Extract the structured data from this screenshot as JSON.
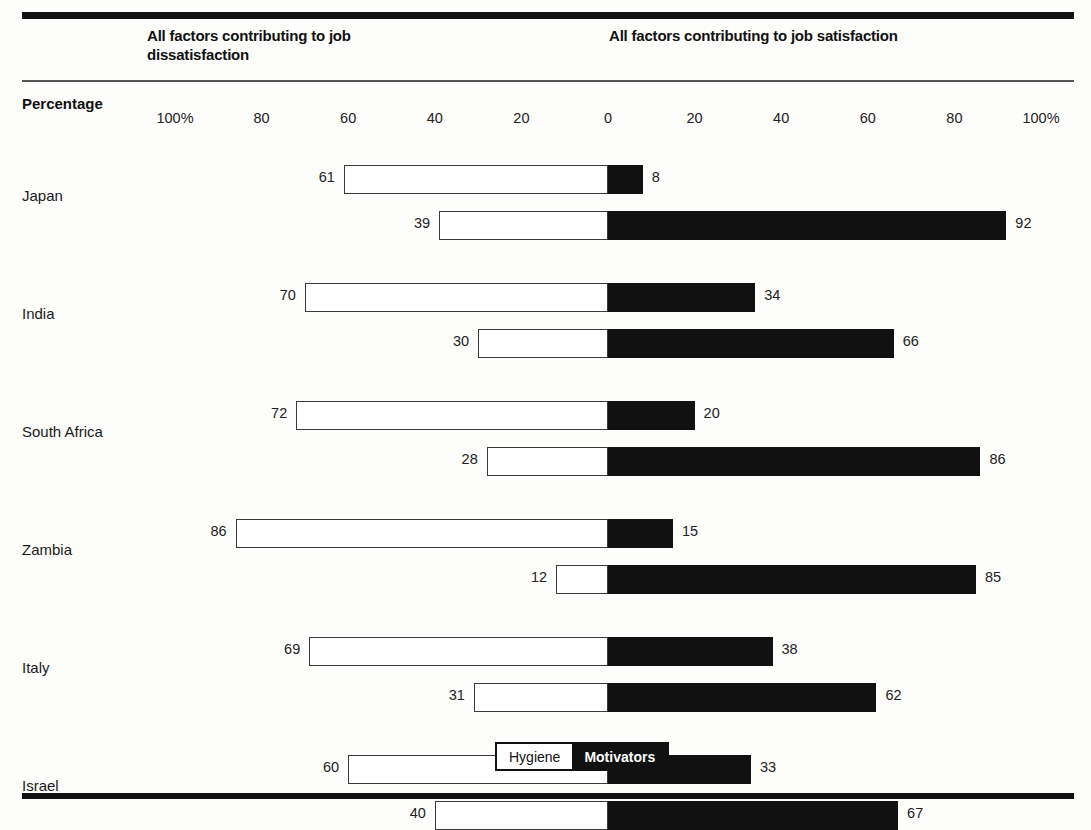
{
  "header": {
    "left_title": "All factors contributing to job dissatisfaction",
    "right_title": "All factors contributing to job satisfaction",
    "axis_label": "Percentage"
  },
  "legend": {
    "hygiene_label": "Hygiene",
    "motivators_label": "Motivators"
  },
  "colors": {
    "hygiene": "#ffffff",
    "motivators": "#111111",
    "rule": "#111111",
    "text": "#1a1a1a"
  },
  "chart_data": {
    "type": "bar",
    "title": "",
    "subtitle": "",
    "orientation": "horizontal-diverging",
    "xlabel": "Percentage",
    "ylabel": "",
    "xlim": [
      -100,
      100
    ],
    "grid": false,
    "legend_position": "bottom-center",
    "tick_labels": [
      "100%",
      "80",
      "60",
      "40",
      "20",
      "0",
      "20",
      "40",
      "60",
      "80",
      "100%"
    ],
    "tick_values": [
      -100,
      -80,
      -60,
      -40,
      -20,
      0,
      20,
      40,
      60,
      80,
      100
    ],
    "left_axis_title": "All factors contributing to job dissatisfaction",
    "right_axis_title": "All factors contributing to job satisfaction",
    "series": [
      {
        "name": "Hygiene",
        "color": "#ffffff",
        "side": "left"
      },
      {
        "name": "Motivators",
        "color": "#111111",
        "side": "right"
      }
    ],
    "categories": [
      "Japan",
      "India",
      "South Africa",
      "Zambia",
      "Italy",
      "Israel"
    ],
    "rows": [
      {
        "country": "Japan",
        "bars": [
          {
            "factor_group": "dissatisfaction",
            "hygiene": 61,
            "motivators": 8
          },
          {
            "factor_group": "satisfaction",
            "hygiene": 39,
            "motivators": 92
          }
        ]
      },
      {
        "country": "India",
        "bars": [
          {
            "factor_group": "dissatisfaction",
            "hygiene": 70,
            "motivators": 34
          },
          {
            "factor_group": "satisfaction",
            "hygiene": 30,
            "motivators": 66
          }
        ]
      },
      {
        "country": "South Africa",
        "bars": [
          {
            "factor_group": "dissatisfaction",
            "hygiene": 72,
            "motivators": 20
          },
          {
            "factor_group": "satisfaction",
            "hygiene": 28,
            "motivators": 86
          }
        ]
      },
      {
        "country": "Zambia",
        "bars": [
          {
            "factor_group": "dissatisfaction",
            "hygiene": 86,
            "motivators": 15
          },
          {
            "factor_group": "satisfaction",
            "hygiene": 12,
            "motivators": 85
          }
        ]
      },
      {
        "country": "Italy",
        "bars": [
          {
            "factor_group": "dissatisfaction",
            "hygiene": 69,
            "motivators": 38
          },
          {
            "factor_group": "satisfaction",
            "hygiene": 31,
            "motivators": 62
          }
        ]
      },
      {
        "country": "Israel",
        "bars": [
          {
            "factor_group": "dissatisfaction",
            "hygiene": 60,
            "motivators": 33
          },
          {
            "factor_group": "satisfaction",
            "hygiene": 40,
            "motivators": 67
          }
        ]
      }
    ]
  },
  "geometry": {
    "zero_x": 608,
    "px_per_unit": 4.33,
    "first_bar_top": 165,
    "bar_height": 29,
    "bar_gap": 17,
    "group_gap": 43,
    "label_offset": 16
  }
}
